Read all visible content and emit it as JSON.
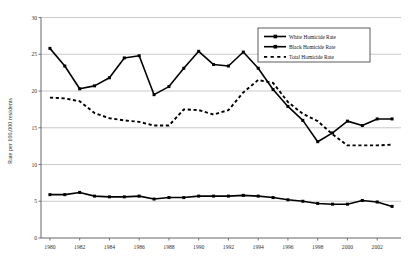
{
  "chart_data": {
    "type": "line",
    "title": "",
    "xlabel": "",
    "ylabel": "Rate per 100,000 residents",
    "xlim": [
      1979.4,
      2003.6
    ],
    "ylim": [
      0,
      30
    ],
    "yticks": [
      0,
      5,
      10,
      15,
      20,
      25,
      30
    ],
    "xticks": [
      1980,
      1982,
      1984,
      1986,
      1988,
      1990,
      1992,
      1994,
      1996,
      1998,
      2000,
      2002
    ],
    "x": [
      1980,
      1981,
      1982,
      1983,
      1984,
      1985,
      1986,
      1987,
      1988,
      1989,
      1990,
      1991,
      1992,
      1993,
      1994,
      1995,
      1996,
      1997,
      1998,
      1999,
      2000,
      2001,
      2002,
      2003
    ],
    "grid": "horizontal",
    "legend_position": "top-right",
    "series": [
      {
        "name": "White Homicide Rate",
        "marker": "filled-square",
        "style": "solid",
        "color": "#000000",
        "values": [
          5.9,
          5.9,
          6.2,
          5.7,
          5.6,
          5.6,
          5.7,
          5.3,
          5.5,
          5.5,
          5.7,
          5.7,
          5.7,
          5.8,
          5.7,
          5.5,
          5.2,
          5.0,
          4.7,
          4.6,
          4.6,
          5.1,
          4.9,
          4.3
        ]
      },
      {
        "name": "Black Homicide Rate",
        "marker": "filled-square",
        "style": "solid",
        "color": "#000000",
        "values": [
          25.8,
          23.4,
          20.3,
          20.7,
          21.8,
          24.5,
          24.8,
          19.5,
          20.6,
          23.1,
          25.4,
          23.6,
          23.4,
          25.3,
          23.1,
          20.2,
          17.9,
          16.0,
          13.1,
          14.3,
          15.9,
          15.3,
          16.2,
          16.2
        ]
      },
      {
        "name": "Total Homicide Rate",
        "marker": "dashed",
        "style": "dashed",
        "color": "#000000",
        "values": [
          19.1,
          19.0,
          18.6,
          17.0,
          16.3,
          16.0,
          15.8,
          15.3,
          15.3,
          17.5,
          17.4,
          16.8,
          17.4,
          19.8,
          21.5,
          21.1,
          18.5,
          16.9,
          15.9,
          14.1,
          12.6,
          12.6,
          12.6,
          12.7
        ]
      }
    ]
  },
  "legend": {
    "items": [
      {
        "label": "White Homicide Rate",
        "swatch": "solid-line-square-marker"
      },
      {
        "label": "Black Homicide Rate",
        "swatch": "solid-line-square-marker"
      },
      {
        "label": "Total Homicide Rate",
        "swatch": "dashed-line-square-marker"
      }
    ]
  },
  "axes": {
    "y_title": "Rate per 100,000 residents",
    "y_tick_labels": [
      "0",
      "5",
      "10",
      "15",
      "20",
      "25",
      "30"
    ],
    "x_tick_labels": [
      "1980",
      "1982",
      "1984",
      "1986",
      "1988",
      "1990",
      "1992",
      "1994",
      "1996",
      "1998",
      "2000",
      "2002"
    ]
  }
}
